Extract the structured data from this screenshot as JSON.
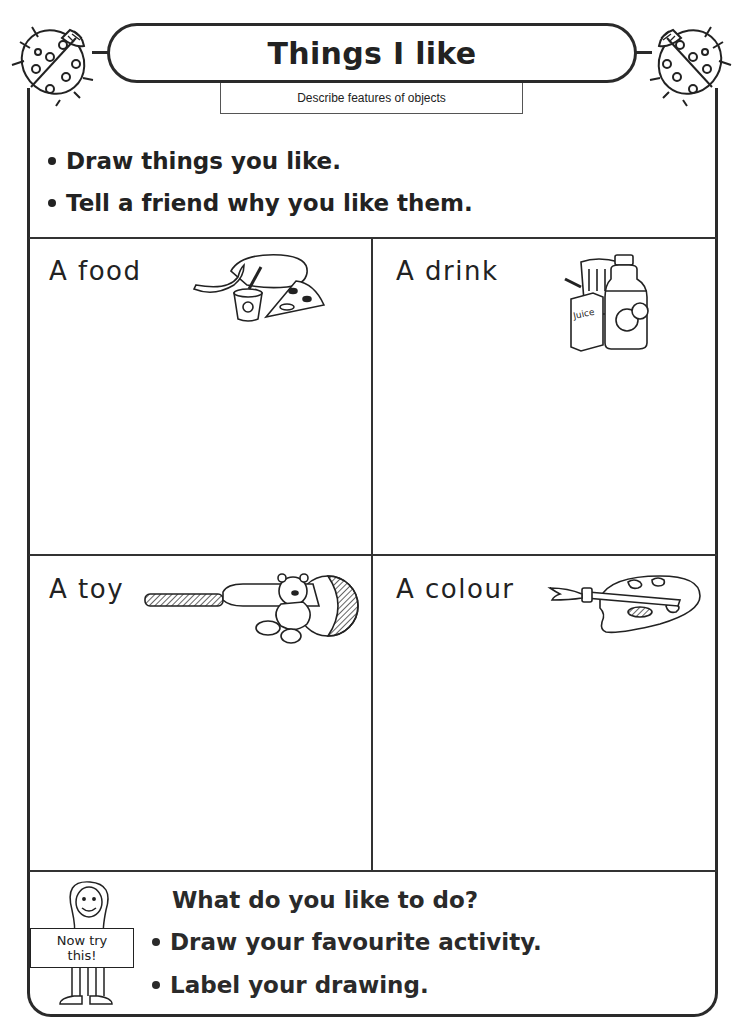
{
  "header": {
    "title": "Things I like",
    "subtitle": "Describe features of objects",
    "decorations": [
      "ladybird-icon",
      "ladybird-icon"
    ]
  },
  "instructions": [
    "Draw things you like.",
    "Tell a friend why you like them."
  ],
  "cells": [
    {
      "label": "A food",
      "icon": "food-icon",
      "icon_parts": [
        "banana",
        "yoghurt pot",
        "bread loaf",
        "pizza slice"
      ]
    },
    {
      "label": "A drink",
      "icon": "drink-icon",
      "icon_parts": [
        "glass",
        "juice box",
        "orange juice bottle"
      ],
      "juice_label": "Juice"
    },
    {
      "label": "A toy",
      "icon": "toy-icon",
      "icon_parts": [
        "cricket bat",
        "teddy bear",
        "ball"
      ]
    },
    {
      "label": "A colour",
      "icon": "paint-palette-icon",
      "icon_parts": [
        "paintbrush",
        "palette"
      ]
    }
  ],
  "bottom": {
    "sign_line1": "Now try",
    "sign_line2": "this!",
    "question": "What do you like to do?",
    "items": [
      "Draw your favourite activity.",
      "Label your drawing."
    ]
  },
  "colors": {
    "ink": "#222222",
    "background": "#ffffff"
  }
}
